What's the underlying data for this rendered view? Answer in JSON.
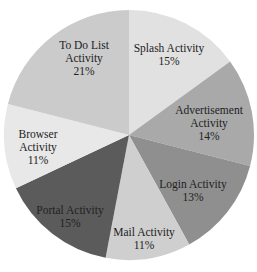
{
  "chart_data": {
    "type": "pie",
    "title": "",
    "start_angle_deg": 0,
    "direction": "clockwise",
    "center": [
      129,
      135
    ],
    "radius": 125,
    "slices": [
      {
        "label": "Splash Activity",
        "value": 15,
        "pct_label": "15%",
        "color": "#e1e1e1",
        "label_lines": [
          "Splash Activity",
          "15%"
        ],
        "label_pos": [
          169,
          55
        ]
      },
      {
        "label": "Advertisement Activity",
        "value": 14,
        "pct_label": "14%",
        "color": "#a9a9a9",
        "label_lines": [
          "Advertisement",
          "Activity",
          "14%"
        ],
        "label_pos": [
          209,
          123
        ]
      },
      {
        "label": "Login Activity",
        "value": 13,
        "pct_label": "13%",
        "color": "#8f8f8f",
        "label_lines": [
          "Login Activity",
          "13%"
        ],
        "label_pos": [
          193,
          191
        ]
      },
      {
        "label": "Mail Activity",
        "value": 11,
        "pct_label": "11%",
        "color": "#cfcfcf",
        "label_lines": [
          "Mail Activity",
          "11%"
        ],
        "label_pos": [
          144,
          239
        ]
      },
      {
        "label": "Portal Activity",
        "value": 15,
        "pct_label": "15%",
        "color": "#5b5b5b",
        "label_lines": [
          "Portal Activity",
          "15%"
        ],
        "label_pos": [
          70,
          217
        ]
      },
      {
        "label": "Browser Activity",
        "value": 11,
        "pct_label": "11%",
        "color": "#e8e8e8",
        "label_lines": [
          "Browser",
          "Activity",
          "11%"
        ],
        "label_pos": [
          38,
          147
        ]
      },
      {
        "label": "To Do List Activity",
        "value": 21,
        "pct_label": "21%",
        "color": "#cbcbcb",
        "label_lines": [
          "To Do List",
          "Activity",
          "21%"
        ],
        "label_pos": [
          84,
          58
        ]
      }
    ],
    "legend": null
  }
}
